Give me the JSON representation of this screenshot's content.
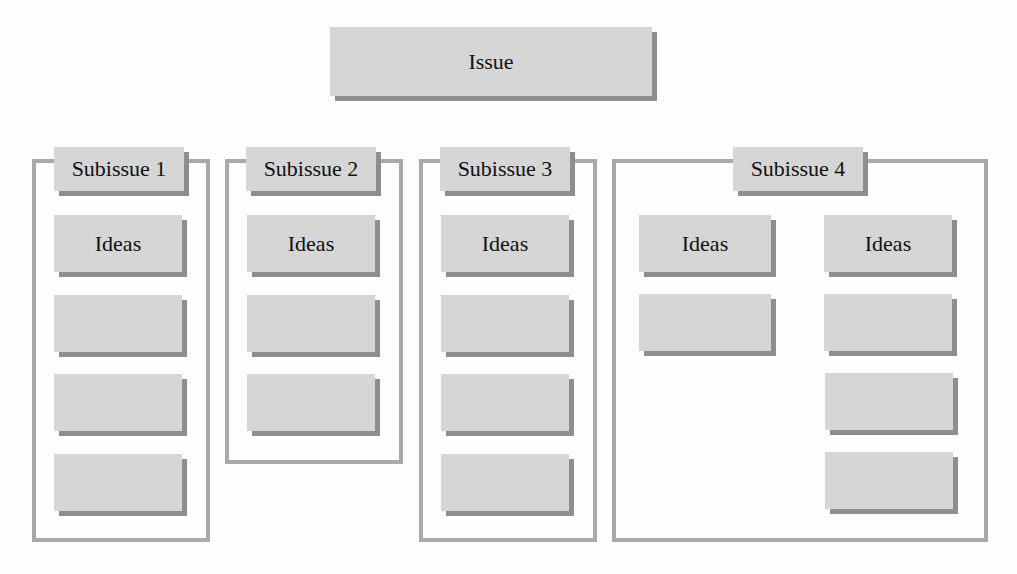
{
  "diagram": {
    "type": "issue-tree",
    "colors": {
      "box_fill": "#d6d6d6",
      "box_shadow": "#8e8e8e",
      "frame_border": "#a9a9a9",
      "background": "#fdfdfd"
    },
    "issue": {
      "label": "Issue"
    },
    "subissues": [
      {
        "label": "Subissue 1",
        "columns": [
          {
            "items": [
              "Ideas",
              "",
              "",
              ""
            ]
          }
        ]
      },
      {
        "label": "Subissue 2",
        "columns": [
          {
            "items": [
              "Ideas",
              "",
              ""
            ]
          }
        ]
      },
      {
        "label": "Subissue 3",
        "columns": [
          {
            "items": [
              "Ideas",
              "",
              "",
              ""
            ]
          }
        ]
      },
      {
        "label": "Subissue 4",
        "columns": [
          {
            "items": [
              "Ideas",
              ""
            ]
          },
          {
            "items": [
              "Ideas",
              "",
              "",
              ""
            ]
          }
        ]
      }
    ]
  }
}
